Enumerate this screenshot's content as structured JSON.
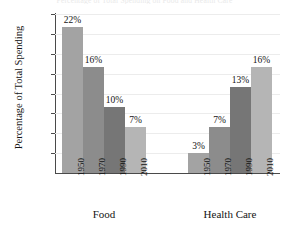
{
  "chart_data": {
    "type": "bar",
    "title": "Percentage of Total Spending on Food and Health Care",
    "xlabel": "",
    "ylabel": "Percentage of Total Spending",
    "categories": [
      "1950",
      "1970",
      "1990",
      "2010"
    ],
    "groups": [
      {
        "name": "Food",
        "values": [
          22,
          16,
          10,
          7
        ],
        "value_labels": [
          "22%",
          "16%",
          "10%",
          "7%"
        ]
      },
      {
        "name": "Health Care",
        "values": [
          3,
          7,
          13,
          16
        ],
        "value_labels": [
          "3%",
          "7%",
          "13%",
          "16%"
        ]
      }
    ],
    "ylim": [
      0,
      24
    ],
    "ytick_values": [
      3,
      6,
      9,
      12,
      15,
      18,
      21,
      24
    ],
    "ytick_labels": [
      "3%",
      "6%",
      "9%",
      "12%",
      "15%",
      "18%",
      "21%",
      "24%"
    ],
    "grid": true,
    "legend": "none",
    "bar_colors": [
      "#a3a3a3",
      "#8c8c8c",
      "#767676",
      "#b5b5b5"
    ],
    "axis_color": "#4a4a4a",
    "gridline_color": "#ececec",
    "background": "#ffffff"
  }
}
